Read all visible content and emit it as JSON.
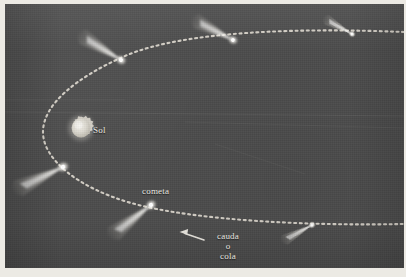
{
  "figure": {
    "kind": "astronomy-diagram",
    "language": "es",
    "background_color": "#4c4c4c",
    "ink_color": "#e9e7e0",
    "paper_color": "#eceae4"
  },
  "labels": {
    "sun": "Sol",
    "comet": "cometa",
    "tail_line1": "cauda",
    "tail_line2": "o",
    "tail_line3": "cola"
  },
  "sun": {
    "label": "Sol",
    "cx": 76,
    "cy": 124,
    "r": 11,
    "color": "#d9d7cf"
  },
  "orbit": {
    "style": "dotted",
    "color": "#ded9cf",
    "dot_size": 2,
    "gap": 3,
    "description": "elongated ellipse, perihelion at left near the Sun"
  },
  "comets": [
    {
      "name": "comet-upper-left",
      "x": 116,
      "y": 56,
      "tail_angle_deg": -36,
      "tail_length": 48,
      "head_size": 5
    },
    {
      "name": "comet-upper-mid",
      "x": 228,
      "y": 36,
      "tail_angle_deg": -40,
      "tail_length": 42,
      "head_size": 5
    },
    {
      "name": "comet-upper-right",
      "x": 344,
      "y": 32,
      "tail_angle_deg": -36,
      "tail_length": 30,
      "head_size": 4
    },
    {
      "name": "comet-left-edge",
      "x": 56,
      "y": 162,
      "tail_angle_deg": -205,
      "tail_length": 56,
      "head_size": 5
    },
    {
      "name": "comet-labeled",
      "x": 143,
      "y": 199,
      "tail_angle_deg": 36,
      "tail_length": 50,
      "head_size": 5
    },
    {
      "name": "comet-lower-right",
      "x": 305,
      "y": 222,
      "tail_angle_deg": 150,
      "tail_length": 32,
      "head_size": 4
    }
  ],
  "annotation_arrow": {
    "name": "tail-pointer-arrow",
    "from_x": 200,
    "from_y": 237,
    "to_x": 176,
    "to_y": 229,
    "color": "#e9e7e0"
  }
}
